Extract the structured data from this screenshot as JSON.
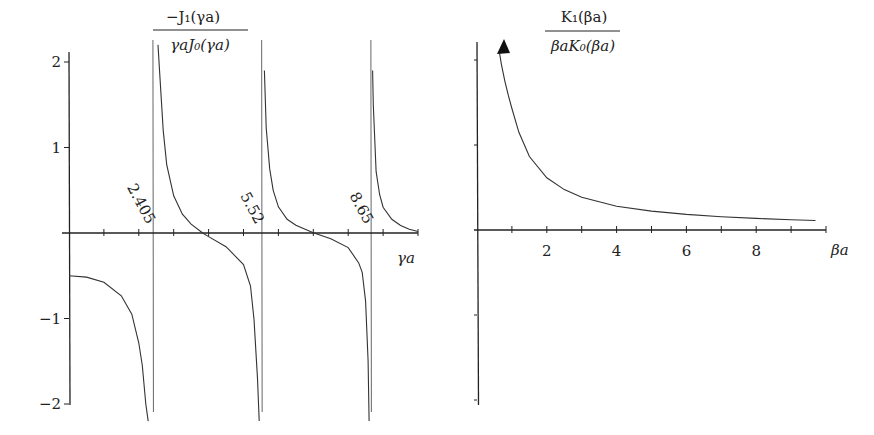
{
  "chart_data": [
    {
      "type": "line",
      "title": "-J1(γa) / (γa J0(γa))",
      "title_numerator": "−J₁(γa)",
      "title_denominator": "γaJ₀(γa)",
      "xlabel": "γa",
      "ylabel": "",
      "xlim": [
        0,
        10
      ],
      "ylim": [
        -2,
        2
      ],
      "yticks": [
        2,
        1,
        -1,
        -2
      ],
      "ytick_labels": [
        "2",
        "1",
        "−1",
        "−2"
      ],
      "xticks": [
        1,
        2,
        3,
        4,
        5,
        6,
        7,
        8,
        9,
        10
      ],
      "grid": false,
      "asymptotes": [
        {
          "x": 2.405,
          "label": "2.405"
        },
        {
          "x": 5.52,
          "label": "5.52"
        },
        {
          "x": 8.65,
          "label": "8.65"
        }
      ],
      "series": [
        {
          "name": "branch-1",
          "x": [
            0,
            0.5,
            1.0,
            1.5,
            1.8,
            2.0,
            2.1,
            2.2,
            2.27
          ],
          "y": [
            -0.5,
            -0.516,
            -0.575,
            -0.735,
            -0.95,
            -1.286,
            -1.55,
            -2.0,
            -2.2
          ]
        },
        {
          "name": "branch-2",
          "x": [
            2.55,
            2.6,
            2.7,
            2.8,
            3.0,
            3.25,
            3.5,
            3.83,
            4.0,
            4.5,
            5.0,
            5.2,
            5.3,
            5.4,
            5.45
          ],
          "y": [
            2.2,
            1.87,
            1.2,
            0.8,
            0.435,
            0.22,
            0.103,
            0.0,
            -0.042,
            -0.16,
            -0.369,
            -0.62,
            -1.01,
            -1.7,
            -2.2
          ]
        },
        {
          "name": "branch-3",
          "x": [
            5.6,
            5.65,
            5.75,
            5.85,
            6.0,
            6.25,
            6.5,
            7.0,
            7.5,
            8.0,
            8.3,
            8.4,
            8.5,
            8.57,
            8.6
          ],
          "y": [
            1.9,
            1.23,
            0.75,
            0.5,
            0.306,
            0.16,
            0.091,
            0.002,
            -0.068,
            -0.171,
            -0.35,
            -0.46,
            -0.8,
            -1.5,
            -2.2
          ]
        },
        {
          "name": "branch-4",
          "x": [
            8.7,
            8.72,
            8.8,
            8.9,
            9.0,
            9.25,
            9.5,
            9.75,
            10.0
          ],
          "y": [
            1.9,
            1.5,
            0.72,
            0.45,
            0.302,
            0.16,
            0.088,
            0.045,
            0.018
          ]
        }
      ]
    },
    {
      "type": "line",
      "title": "K1(βa) / (βa K0(βa))",
      "title_numerator": "K₁(βa)",
      "title_denominator": "βaK₀(βa)",
      "xlabel": "βa",
      "ylabel": "",
      "xlim": [
        0,
        10
      ],
      "ylim": [
        -2,
        2
      ],
      "xticks": [
        1,
        2,
        3,
        4,
        5,
        6,
        7,
        8,
        9,
        10
      ],
      "xtick_labels": [
        "2",
        "4",
        "6",
        "8"
      ],
      "xtick_label_values": [
        2,
        4,
        6,
        8
      ],
      "yticks": [
        2,
        1,
        -1,
        -2
      ],
      "ytick_labels": [],
      "grid": false,
      "arrow_at_top": true,
      "series": [
        {
          "name": "K-ratio",
          "x": [
            0.64,
            0.7,
            0.8,
            0.9,
            1.0,
            1.2,
            1.5,
            2.0,
            2.5,
            3.0,
            4.0,
            5.0,
            6.0,
            7.0,
            8.0,
            9.0,
            9.7
          ],
          "y": [
            2.1,
            1.95,
            1.75,
            1.58,
            1.43,
            1.15,
            0.865,
            0.614,
            0.475,
            0.385,
            0.28,
            0.222,
            0.183,
            0.156,
            0.136,
            0.12,
            0.112
          ]
        }
      ]
    }
  ]
}
